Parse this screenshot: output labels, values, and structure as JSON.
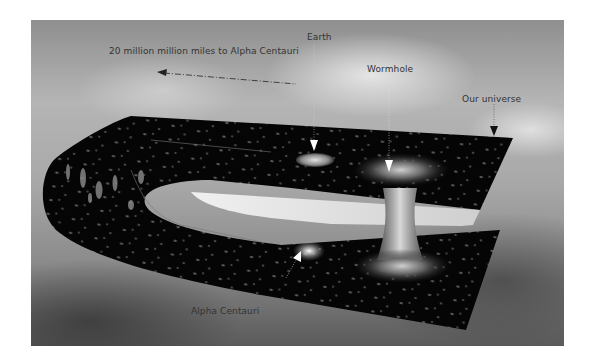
{
  "figure": {
    "labels": {
      "distance": "20 million million miles to Alpha Centauri",
      "earth": "Earth",
      "wormhole": "Wormhole",
      "our_universe": "Our universe",
      "alpha_centauri": "Alpha Centauri"
    },
    "colors": {
      "sky_light": "#b5b5b5",
      "sky_dark": "#5a5a5a",
      "space_sheet": "#050505",
      "label_text": "#333333"
    }
  }
}
